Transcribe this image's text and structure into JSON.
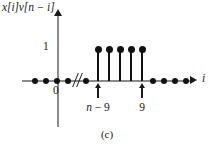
{
  "figure": {
    "caption": "(c)",
    "y_axis_label": "x[i]v[n − i]",
    "x_axis_label": "i",
    "origin_label": "0",
    "amplitude_label": "1",
    "annotations": [
      {
        "label_math": "n − 9",
        "x": 98
      },
      {
        "label_math": "9",
        "x": 142
      }
    ]
  },
  "chart_data": {
    "type": "bar",
    "title": "",
    "subtitle": "(c)",
    "xlabel": "i",
    "ylabel": "x[i]v[n − i]",
    "grid": false,
    "legend": null,
    "ylim": [
      0,
      1.25
    ],
    "ytick_labels": [
      "1"
    ],
    "ytick_values": [
      1
    ],
    "xtick_labels": [
      "0",
      "n − 9",
      "9"
    ],
    "axis_break": true,
    "axis_break_symbol": "//",
    "categories": [
      "...",
      "...",
      "...",
      "...",
      "...",
      "n-9",
      "n-8",
      "n-7",
      "n-6",
      "9",
      "...",
      "...",
      "...",
      "..."
    ],
    "values": [
      0,
      0,
      0,
      0,
      0,
      1,
      1,
      1,
      1,
      1,
      0,
      0,
      0,
      0
    ],
    "nonzero_count": 5,
    "nonzero_value": 1,
    "zero_samples_left": 5,
    "zero_samples_right": 4,
    "stems": [
      {
        "x": 98,
        "value": 1
      },
      {
        "x": 109,
        "value": 1
      },
      {
        "x": 120,
        "value": 1
      },
      {
        "x": 131,
        "value": 1
      },
      {
        "x": 142,
        "value": 1
      }
    ],
    "zero_dots_left_x": [
      35,
      46,
      57,
      68,
      86
    ],
    "zero_dots_right_x": [
      153,
      164,
      175,
      186
    ]
  },
  "colors": {
    "axis": "#8a8a8a",
    "ink": "#111111",
    "background": "#ffffff"
  }
}
